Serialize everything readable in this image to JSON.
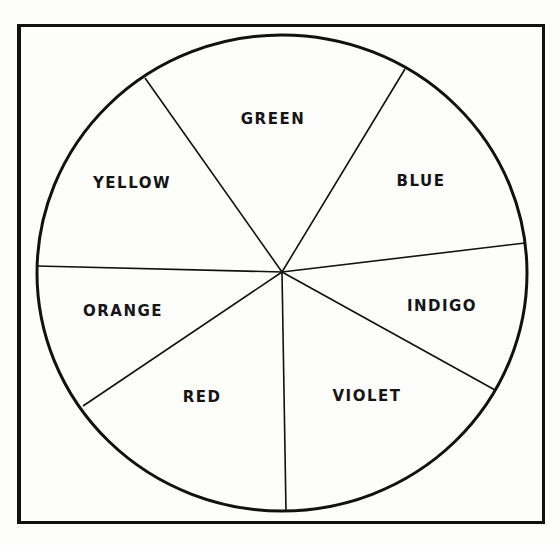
{
  "diagram": {
    "type": "color-wheel",
    "center": [
      282,
      272
    ],
    "radius": 244,
    "line_color": "#111111",
    "background": "#fdfdfb",
    "divider_endpoints": [
      [
        145,
        78
      ],
      [
        405,
        69
      ],
      [
        525,
        243
      ],
      [
        495,
        390
      ],
      [
        286,
        511
      ],
      [
        83,
        406
      ],
      [
        37,
        266
      ]
    ],
    "segments": [
      {
        "label": "GREEN",
        "x": 273,
        "y": 119
      },
      {
        "label": "BLUE",
        "x": 421,
        "y": 181
      },
      {
        "label": "INDIGO",
        "x": 442,
        "y": 306
      },
      {
        "label": "VIOLET",
        "x": 367,
        "y": 396
      },
      {
        "label": "RED",
        "x": 202,
        "y": 397
      },
      {
        "label": "ORANGE",
        "x": 123,
        "y": 311
      },
      {
        "label": "YELLOW",
        "x": 132,
        "y": 183
      }
    ]
  }
}
